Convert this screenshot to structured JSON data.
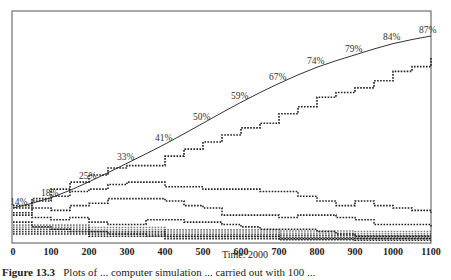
{
  "chart_data": {
    "type": "line",
    "title": "",
    "xlabel": "Time: 2000",
    "ylabel": "",
    "xlim": [
      0,
      1100
    ],
    "ylim": [
      0,
      100
    ],
    "grid": false,
    "legend": "none",
    "x_ticks": [
      "0",
      "100",
      "200",
      "300",
      "400",
      "500",
      "600",
      "700",
      "800",
      "900",
      "1000",
      "1100"
    ],
    "series": [
      {
        "name": "theoretical curve (solid)",
        "style": "solid",
        "x": [
          0,
          100,
          200,
          300,
          400,
          500,
          600,
          700,
          800,
          900,
          1000,
          1100
        ],
        "values": [
          14,
          18,
          25,
          33,
          41,
          50,
          59,
          67,
          74,
          79,
          84,
          87
        ],
        "labels": [
          "14%",
          "18%",
          "25%",
          "33%",
          "41%",
          "50%",
          "59%",
          "67%",
          "74%",
          "79%",
          "84%",
          "87%"
        ]
      },
      {
        "name": "leading allele (dotted)",
        "style": "dotted",
        "x": [
          0,
          50,
          100,
          150,
          200,
          250,
          300,
          350,
          400,
          450,
          500,
          550,
          600,
          650,
          700,
          750,
          800,
          850,
          900,
          950,
          1000,
          1050,
          1100
        ],
        "values": [
          15,
          18,
          22,
          25,
          28,
          31,
          32,
          32,
          36,
          39,
          42,
          45,
          48,
          50,
          54,
          57,
          61,
          63,
          65,
          68,
          72,
          74,
          78
        ]
      },
      {
        "name": "competing allele A (dotted)",
        "style": "dotted",
        "x": [
          0,
          50,
          100,
          150,
          200,
          250,
          300,
          350,
          400,
          450,
          500,
          550,
          600,
          650,
          700,
          750,
          800,
          850,
          900,
          950,
          1000,
          1050,
          1100
        ],
        "values": [
          14,
          17,
          19,
          21,
          22,
          24,
          25,
          25,
          23,
          23,
          22,
          22,
          22,
          21,
          21,
          19,
          17,
          15,
          17,
          15,
          14,
          13,
          12
        ]
      },
      {
        "name": "competing allele B (dotted)",
        "style": "dotted",
        "x": [
          0,
          50,
          100,
          150,
          200,
          250,
          300,
          350,
          400,
          450,
          500,
          550,
          600,
          650,
          700,
          750,
          800,
          850,
          900,
          950,
          1000,
          1050,
          1100
        ],
        "values": [
          12,
          14,
          13,
          15,
          16,
          18,
          18,
          18,
          17,
          15,
          14,
          11,
          11,
          11,
          10,
          11,
          11,
          10,
          9,
          7,
          7,
          7,
          6
        ]
      },
      {
        "name": "competing allele C (dotted)",
        "style": "dotted",
        "x": [
          0,
          50,
          100,
          150,
          200,
          250,
          300,
          350,
          400,
          450,
          500,
          550,
          600,
          650,
          700,
          750,
          800,
          850,
          900,
          950,
          1000,
          1050,
          1100
        ],
        "values": [
          11,
          10,
          9,
          10,
          8,
          7,
          7,
          9,
          9,
          8,
          8,
          7,
          6,
          5,
          5,
          5,
          4,
          3,
          2,
          2,
          2,
          2,
          2
        ]
      },
      {
        "name": "competing allele D (dotted)",
        "style": "dotted",
        "x": [
          0,
          50,
          100,
          150,
          200,
          250,
          300,
          350,
          400,
          450,
          500,
          550,
          600,
          650,
          700,
          750,
          800,
          850,
          900,
          950,
          1000,
          1050,
          1100
        ],
        "values": [
          8,
          6,
          5,
          4,
          4,
          3,
          3,
          2,
          2,
          2,
          2,
          2,
          2,
          2,
          1,
          1,
          1,
          1,
          1,
          1,
          1,
          1,
          1
        ]
      },
      {
        "name": "minor alleles cluster (dotted)",
        "style": "dotted",
        "x": [
          0,
          100,
          200,
          300,
          400,
          500,
          600,
          700,
          800,
          900,
          1000,
          1100
        ],
        "values": [
          3,
          3,
          2,
          2,
          1,
          1,
          1,
          0.5,
          0.5,
          0.3,
          0.3,
          0.3
        ]
      }
    ]
  },
  "axis": {
    "xlabel": "Time: 2000"
  },
  "caption": {
    "label": "Figure 13.3",
    "text": "Plots of ... computer simulation ... carried out with 100 ..."
  }
}
